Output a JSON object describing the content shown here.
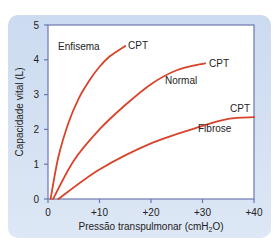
{
  "chart_data": {
    "type": "line",
    "title": "",
    "xlabel": "Pressão transpulmonar (cmH2O)",
    "xlabel_parts": {
      "pre": "Pressão transpulmonar (cmH",
      "sub": "2",
      "post": "O)"
    },
    "ylabel": "Capacidade vital (L)",
    "xlim": [
      0,
      40
    ],
    "ylim": [
      0,
      5
    ],
    "x_ticks": [
      "0",
      "+10",
      "+20",
      "+30",
      "+40"
    ],
    "y_ticks": [
      "0",
      "1",
      "2",
      "3",
      "4",
      "5"
    ],
    "grid": false,
    "legend": "inline labels",
    "series": [
      {
        "name": "Enfisema",
        "end_label": "CPT",
        "color": "#d9432b",
        "x": [
          0.5,
          2,
          4,
          6,
          8,
          10,
          12,
          15
        ],
        "y": [
          0,
          1.2,
          2.2,
          2.9,
          3.4,
          3.8,
          4.1,
          4.4
        ]
      },
      {
        "name": "Normal",
        "end_label": "CPT",
        "color": "#d9432b",
        "x": [
          1,
          5,
          10,
          15,
          20,
          25,
          30.5
        ],
        "y": [
          0,
          1.1,
          2.0,
          2.7,
          3.3,
          3.7,
          3.9
        ]
      },
      {
        "name": "Fibrose",
        "end_label": "CPT",
        "color": "#d9432b",
        "x": [
          2,
          10,
          20,
          30,
          35,
          40
        ],
        "y": [
          0,
          0.85,
          1.6,
          2.1,
          2.3,
          2.35
        ]
      }
    ]
  },
  "labels": {
    "enfisema": "Enfisema",
    "normal": "Normal",
    "fibrose": "Fibrose",
    "cpt": "CPT"
  },
  "colors": {
    "curve": "#d9432b",
    "axis": "#6a78b0",
    "panel": "#d6e2f3"
  }
}
